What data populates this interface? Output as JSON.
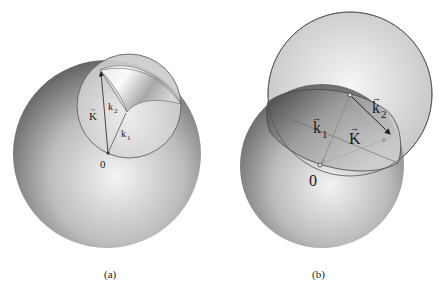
{
  "figure": {
    "panels": [
      {
        "id": "a",
        "caption": "(a)",
        "labels": {
          "K": "K",
          "k1": "k",
          "k1_sub": "1",
          "k2": "k",
          "k2_sub": "2",
          "origin": "0"
        },
        "arrow_glyph": "→"
      },
      {
        "id": "b",
        "caption": "(b)",
        "labels": {
          "K": "K",
          "k1": "k",
          "k1_sub": "1",
          "k2": "k",
          "k2_sub": "2",
          "origin": "0"
        },
        "arrow_glyph": "→"
      }
    ],
    "colors": {
      "sphere_dark": "#5a5a5a",
      "sphere_light": "#f2f2f2",
      "outline": "#4a4a4a",
      "vector": "#333333"
    }
  }
}
